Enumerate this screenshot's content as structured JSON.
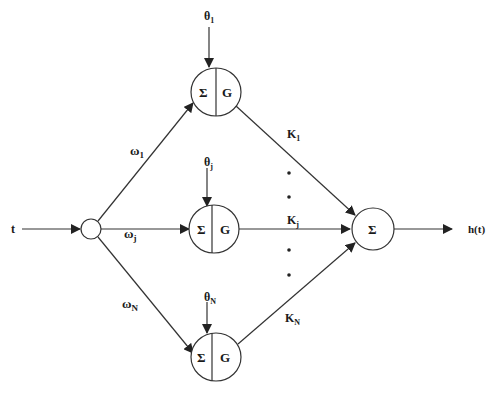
{
  "diagram": {
    "type": "neural-network-schematic",
    "colors": {
      "stroke": "#333333",
      "text": "#1a1a1a",
      "background": "#ffffff"
    },
    "input": {
      "label": "t"
    },
    "output": {
      "label": "h(t)",
      "node_symbol": "Σ"
    },
    "hidden_nodes": [
      {
        "id": "node-1",
        "sum_symbol": "Σ",
        "activation_symbol": "G",
        "bias_label": "θ",
        "bias_sub": "1",
        "input_weight": "ω",
        "input_weight_sub": "1",
        "output_weight": "K",
        "output_weight_sub": "1"
      },
      {
        "id": "node-j",
        "sum_symbol": "Σ",
        "activation_symbol": "G",
        "bias_label": "θ",
        "bias_sub": "j",
        "input_weight": "ω",
        "input_weight_sub": "j",
        "output_weight": "K",
        "output_weight_sub": "j"
      },
      {
        "id": "node-N",
        "sum_symbol": "Σ",
        "activation_symbol": "G",
        "bias_label": "θ",
        "bias_sub": "N",
        "input_weight": "ω",
        "input_weight_sub": "N",
        "output_weight": "K",
        "output_weight_sub": "N"
      }
    ],
    "ellipsis_dots": "•"
  }
}
